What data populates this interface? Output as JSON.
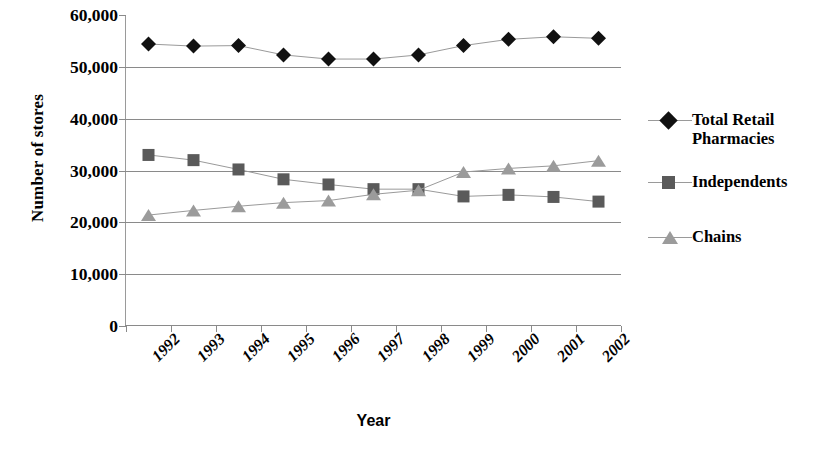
{
  "chart_data": {
    "type": "line",
    "title": "",
    "xlabel": "Year",
    "ylabel": "Number of stores",
    "categories": [
      "1992",
      "1993",
      "1994",
      "1995",
      "1996",
      "1997",
      "1998",
      "1999",
      "2000",
      "2001",
      "2002"
    ],
    "ylim": [
      0,
      60000
    ],
    "yticks": [
      0,
      10000,
      20000,
      30000,
      40000,
      50000,
      60000
    ],
    "ytick_labels": [
      "0",
      "10,000",
      "20,000",
      "30,000",
      "40,000",
      "50,000",
      "60,000"
    ],
    "grid": "horizontal",
    "legend_position": "right",
    "series": [
      {
        "name": "Total Retail Pharmacies",
        "marker": "diamond",
        "color": "#111111",
        "values": [
          54400,
          54000,
          54100,
          52300,
          51500,
          51500,
          52300,
          54100,
          55300,
          55800,
          55500
        ]
      },
      {
        "name": "Independents",
        "marker": "square",
        "color": "#5a5a5a",
        "values": [
          33000,
          32000,
          30200,
          28300,
          27300,
          26400,
          26400,
          25000,
          25300,
          24900,
          24000
        ]
      },
      {
        "name": "Chains",
        "marker": "triangle",
        "color": "#9b9b9b",
        "values": [
          21400,
          22300,
          23100,
          23800,
          24200,
          25400,
          26200,
          29700,
          30400,
          30900,
          31900
        ]
      }
    ]
  },
  "axis": {
    "y_title": "Number of stores",
    "x_title": "Year"
  },
  "legend": {
    "items": [
      {
        "label": "Total Retail Pharmacies",
        "marker": "diamond-marker-icon"
      },
      {
        "label": "Independents",
        "marker": "square-marker-icon"
      },
      {
        "label": "Chains",
        "marker": "triangle-marker-icon"
      }
    ]
  }
}
